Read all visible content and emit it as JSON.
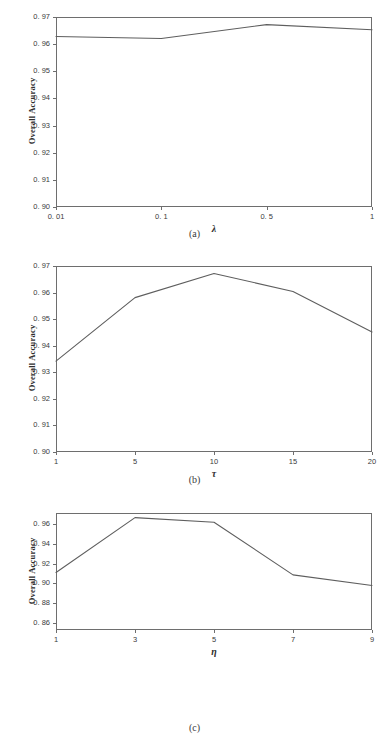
{
  "figure": {
    "panel_count": 3,
    "line_color": "#5e5e5e",
    "axis_color": "#6e6e6e",
    "background": "#ffffff"
  },
  "panels": [
    {
      "caption": "(a)",
      "ylabel": "Overall Accuracy",
      "xlabel": "λ",
      "ytick_labels": [
        "0. 97",
        "0. 96",
        "0. 95",
        "0. 94",
        "0. 93",
        "0. 92",
        "0. 91",
        "0. 90"
      ],
      "xtick_labels": [
        "0. 01",
        "0. 1",
        "0. 5",
        "1"
      ]
    },
    {
      "caption": "(b)",
      "ylabel": "Overall Accuracy",
      "xlabel": "τ",
      "ytick_labels": [
        "0. 97",
        "0. 96",
        "0. 95",
        "0. 94",
        "0. 93",
        "0. 92",
        "0. 91",
        "0. 90"
      ],
      "xtick_labels": [
        "1",
        "5",
        "10",
        "15",
        "20"
      ]
    },
    {
      "caption": "(c)",
      "ylabel": "Overall Accuracy",
      "xlabel": "η",
      "ytick_labels": [
        "0. 96",
        "0. 94",
        "0. 92",
        "0. 90",
        "0. 88",
        "0. 86"
      ],
      "xtick_labels": [
        "1",
        "3",
        "5",
        "7",
        "9"
      ]
    }
  ],
  "chart_data": [
    {
      "type": "line",
      "title": "(a)",
      "xlabel": "λ",
      "ylabel": "Overall Accuracy",
      "categories": [
        "0.01",
        "0.1",
        "0.5",
        "1"
      ],
      "x": [
        0.01,
        0.1,
        0.5,
        1
      ],
      "values": [
        0.9628,
        0.9621,
        0.9672,
        0.9653
      ],
      "ylim": [
        0.9,
        0.97
      ],
      "yticks": [
        0.9,
        0.91,
        0.92,
        0.93,
        0.94,
        0.95,
        0.96,
        0.97
      ],
      "grid": false,
      "legend": null
    },
    {
      "type": "line",
      "title": "(b)",
      "xlabel": "τ",
      "ylabel": "Overall Accuracy",
      "categories": [
        "1",
        "5",
        "10",
        "15",
        "20"
      ],
      "x": [
        1,
        5,
        10,
        15,
        20
      ],
      "values": [
        0.9342,
        0.9581,
        0.9672,
        0.9604,
        0.9452
      ],
      "ylim": [
        0.9,
        0.97
      ],
      "yticks": [
        0.9,
        0.91,
        0.92,
        0.93,
        0.94,
        0.95,
        0.96,
        0.97
      ],
      "grid": false,
      "legend": null
    },
    {
      "type": "line",
      "title": "(c)",
      "xlabel": "η",
      "ylabel": "Overall Accuracy",
      "categories": [
        "1",
        "3",
        "5",
        "7",
        "9"
      ],
      "x": [
        1,
        3,
        5,
        7,
        9
      ],
      "values": [
        0.911,
        0.9668,
        0.9621,
        0.9086,
        0.8978
      ],
      "ylim": [
        0.8525,
        0.9715
      ],
      "yticks": [
        0.86,
        0.88,
        0.9,
        0.92,
        0.94,
        0.96
      ],
      "grid": false,
      "legend": null
    }
  ],
  "geometry": [
    {
      "left": 56,
      "top": 17,
      "width": 316,
      "height": 190
    },
    {
      "left": 56,
      "top": 266,
      "width": 316,
      "height": 186
    },
    {
      "left": 56,
      "top": 513,
      "width": 316,
      "height": 117
    }
  ]
}
